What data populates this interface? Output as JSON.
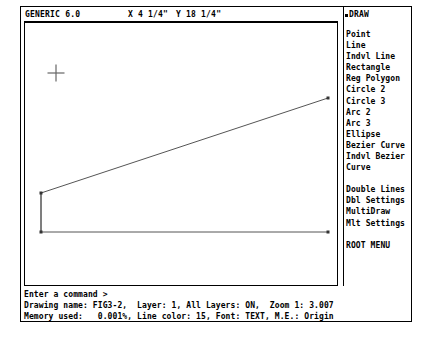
{
  "window": {
    "app_title": "GENERIC 6.0"
  },
  "topbar": {
    "coord_x": "X 4 1/4\"",
    "coord_y": "Y 18 1/4\"",
    "menu_title": "DRAW",
    "menu_title_marker": "bullet-marker-icon"
  },
  "menu": {
    "groups": [
      {
        "items": [
          "Point",
          "Line",
          "Indvl Line",
          "Rectangle",
          "Reg Polygon",
          "Circle 2",
          "Circle 3",
          "Arc 2",
          "Arc 3",
          "Ellipse",
          "Bezier Curve",
          "Indvl Bezier",
          "Curve"
        ]
      },
      {
        "items": [
          "Double Lines",
          "Dbl Settings",
          "MultiDraw",
          "Mlt Settings"
        ]
      },
      {
        "items": [
          "ROOT MENU"
        ]
      }
    ]
  },
  "command": {
    "prompt": "Enter a command >"
  },
  "status": {
    "line1": "Drawing name: FIG3-2,  Layer: 1, All Layers: ON,  Zoom 1: 3.007",
    "line2": "Memory used:   0.001%, Line color: 15, Font: TEXT, M.E.: Origin",
    "drawing_name": "FIG3-2",
    "layer": "1",
    "all_layers": "ON",
    "zoom": "3.007",
    "memory_used": "0.001%",
    "line_color": "15",
    "font": "TEXT",
    "mouse_entry": "Origin"
  },
  "canvas": {
    "stroke_color": "#555555",
    "cursor": {
      "type": "crosshair-cursor",
      "x": 31,
      "y": 50,
      "size": 17
    },
    "shapes": [
      {
        "name": "roof-slope-polyline",
        "type": "polyline",
        "points": "16,170 16,209 16,170 303,75"
      },
      {
        "name": "base-horizontal-line",
        "type": "polyline",
        "points": "16,209 303,209"
      }
    ],
    "vertices": [
      {
        "name": "vertex-left-upper",
        "x": 16,
        "y": 170
      },
      {
        "name": "vertex-left-lower",
        "x": 16,
        "y": 209
      },
      {
        "name": "vertex-right-upper",
        "x": 303,
        "y": 75
      },
      {
        "name": "vertex-right-lower",
        "x": 303,
        "y": 209
      }
    ]
  }
}
